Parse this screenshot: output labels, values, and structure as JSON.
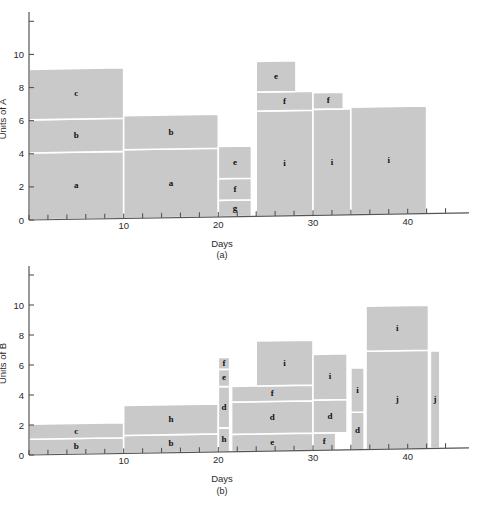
{
  "figure": {
    "background_color": "#ffffff",
    "bar_fill_color": "#c9c9c9",
    "bar_edge_color": "#ffffff",
    "axis_color": "#555555",
    "text_color": "#1a1a1a"
  },
  "chart_data": [
    {
      "id": "a",
      "type": "bar",
      "title": "",
      "caption": "(a)",
      "xlabel": "Days",
      "ylabel": "Units of A",
      "xlim": [
        0,
        45
      ],
      "ylim": [
        0,
        12.2
      ],
      "xticks": [
        0,
        2,
        4,
        6,
        8,
        10,
        12,
        14,
        16,
        18,
        20,
        22,
        24,
        26,
        28,
        30,
        32,
        34,
        36,
        38,
        40,
        42,
        44
      ],
      "xtick_labels": [
        "",
        "",
        "",
        "",
        "",
        "10",
        "",
        "",
        "",
        "",
        "20",
        "",
        "",
        "",
        "",
        "30",
        "",
        "",
        "",
        "",
        "40",
        "",
        ""
      ],
      "yticks": [
        0,
        2,
        4,
        6,
        8,
        10,
        12
      ],
      "ytick_labels": [
        "0",
        "2",
        "4",
        "6",
        "8",
        "10",
        ""
      ],
      "grid": false,
      "legend": "none",
      "blocks": [
        {
          "label": "a",
          "x0": 0,
          "x1": 10,
          "y0": 0,
          "y1": 4.05
        },
        {
          "label": "b",
          "x0": 0,
          "x1": 10,
          "y0": 4.05,
          "y1": 6.05
        },
        {
          "label": "c",
          "x0": 0,
          "x1": 10,
          "y0": 6.05,
          "y1": 9.1
        },
        {
          "label": "a",
          "x0": 10,
          "x1": 20,
          "y0": 0,
          "y1": 4.15
        },
        {
          "label": "b",
          "x0": 10,
          "x1": 20,
          "y0": 4.15,
          "y1": 6.2
        },
        {
          "label": "g",
          "x0": 20,
          "x1": 23.5,
          "y0": 0,
          "y1": 1.0
        },
        {
          "label": "f",
          "x0": 20,
          "x1": 23.5,
          "y0": 1.0,
          "y1": 2.3
        },
        {
          "label": "e",
          "x0": 20,
          "x1": 23.5,
          "y0": 2.3,
          "y1": 4.25
        },
        {
          "label": "i",
          "x0": 24,
          "x1": 30,
          "y0": 0,
          "y1": 6.35
        },
        {
          "label": "f",
          "x0": 24,
          "x1": 30,
          "y0": 6.35,
          "y1": 7.5
        },
        {
          "label": "e",
          "x0": 24,
          "x1": 28.2,
          "y0": 7.5,
          "y1": 9.35
        },
        {
          "label": "i",
          "x0": 30,
          "x1": 34,
          "y0": 0,
          "y1": 6.4
        },
        {
          "label": "f",
          "x0": 30,
          "x1": 33.2,
          "y0": 6.4,
          "y1": 7.4
        },
        {
          "label": "i",
          "x0": 34,
          "x1": 42,
          "y0": 0,
          "y1": 6.5
        }
      ]
    },
    {
      "id": "b",
      "type": "bar",
      "title": "",
      "caption": "(b)",
      "xlabel": "Days",
      "ylabel": "Units of B",
      "xlim": [
        0,
        45
      ],
      "ylim": [
        0,
        12.2
      ],
      "xticks": [
        0,
        2,
        4,
        6,
        8,
        10,
        12,
        14,
        16,
        18,
        20,
        22,
        24,
        26,
        28,
        30,
        32,
        34,
        36,
        38,
        40,
        42,
        44
      ],
      "xtick_labels": [
        "",
        "",
        "",
        "",
        "",
        "10",
        "",
        "",
        "",
        "",
        "20",
        "",
        "",
        "",
        "",
        "30",
        "",
        "",
        "",
        "",
        "40",
        "",
        ""
      ],
      "yticks": [
        0,
        2,
        4,
        6,
        8,
        10,
        12
      ],
      "ytick_labels": [
        "0",
        "2",
        "4",
        "6",
        "8",
        "10",
        ""
      ],
      "grid": false,
      "legend": "none",
      "blocks": [
        {
          "label": "b",
          "x0": 0,
          "x1": 10,
          "y0": 0,
          "y1": 1.05
        },
        {
          "label": "c",
          "x0": 0,
          "x1": 10,
          "y0": 1.05,
          "y1": 2.05
        },
        {
          "label": "b",
          "x0": 10,
          "x1": 20,
          "y0": 0,
          "y1": 1.2
        },
        {
          "label": "h",
          "x0": 10,
          "x1": 20,
          "y0": 1.2,
          "y1": 3.2
        },
        {
          "label": "h",
          "x0": 20,
          "x1": 21.2,
          "y0": 0,
          "y1": 1.6
        },
        {
          "label": "d",
          "x0": 20,
          "x1": 21.2,
          "y0": 1.6,
          "y1": 4.35
        },
        {
          "label": "e",
          "x0": 20,
          "x1": 21.2,
          "y0": 4.35,
          "y1": 5.5
        },
        {
          "label": "f",
          "x0": 20,
          "x1": 21.2,
          "y0": 5.5,
          "y1": 6.3
        },
        {
          "label": "e",
          "x0": 21.4,
          "x1": 30,
          "y0": 0,
          "y1": 1.15
        },
        {
          "label": "d",
          "x0": 21.4,
          "x1": 30,
          "y0": 1.15,
          "y1": 3.3
        },
        {
          "label": "f",
          "x0": 21.4,
          "x1": 30,
          "y0": 3.3,
          "y1": 4.35
        },
        {
          "label": "i",
          "x0": 24,
          "x1": 30,
          "y0": 4.35,
          "y1": 7.35
        },
        {
          "label": "f",
          "x0": 30,
          "x1": 32.4,
          "y0": 0,
          "y1": 1.15
        },
        {
          "label": "d",
          "x0": 30,
          "x1": 33.6,
          "y0": 1.15,
          "y1": 3.35
        },
        {
          "label": "i",
          "x0": 30,
          "x1": 33.6,
          "y0": 3.35,
          "y1": 6.4
        },
        {
          "label": "d",
          "x0": 34,
          "x1": 35.4,
          "y0": 0,
          "y1": 2.5
        },
        {
          "label": "i",
          "x0": 34,
          "x1": 35.4,
          "y0": 2.5,
          "y1": 5.45
        },
        {
          "label": "j",
          "x0": 35.6,
          "x1": 42.2,
          "y0": 0,
          "y1": 6.55
        },
        {
          "label": "i",
          "x0": 35.6,
          "x1": 42.2,
          "y0": 6.55,
          "y1": 9.55
        },
        {
          "label": "j",
          "x0": 42.4,
          "x1": 43.4,
          "y0": 0,
          "y1": 6.5
        }
      ]
    }
  ]
}
